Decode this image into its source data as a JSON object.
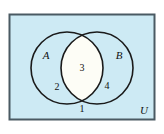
{
  "diagram": {
    "type": "venn-2-set",
    "universe": {
      "label": "U",
      "label_position": "bottom-right",
      "fill_color": "#cdeaf4",
      "border_color": "#4a5a63",
      "border_width": 2
    },
    "sets": [
      {
        "id": "A",
        "label": "A",
        "side": "left",
        "stroke_color": "#1a1a1a",
        "fill": "none"
      },
      {
        "id": "B",
        "label": "B",
        "side": "right",
        "stroke_color": "#1a1a1a",
        "fill": "none"
      }
    ],
    "intersection": {
      "fill_color": "#fdfdf6",
      "stroke_color": "#1a1a1a"
    },
    "regions": [
      {
        "id": "outside",
        "name": "outside-both-sets",
        "count_label": "1",
        "description": "elements in U but in neither A nor B"
      },
      {
        "id": "a-only",
        "name": "a-only",
        "count_label": "2",
        "description": "elements in A only"
      },
      {
        "id": "a-and-b",
        "name": "a-intersect-b",
        "count_label": "3",
        "description": "elements in both A and B"
      },
      {
        "id": "b-only",
        "name": "b-only",
        "count_label": "4",
        "description": "elements in B only"
      }
    ]
  }
}
